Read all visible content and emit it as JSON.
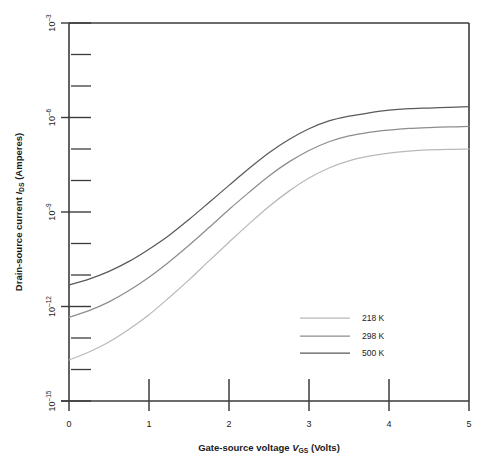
{
  "figure": {
    "background": "#ffffff",
    "axis_color": "#3b3b3b"
  },
  "chart_data": {
    "type": "line",
    "title": "",
    "xlabel_parts": {
      "lead": "Gate-source voltage ",
      "symbol": "V",
      "sub": "GS",
      "tail": " (Volts)"
    },
    "ylabel_parts": {
      "lead": "Drain-source current ",
      "symbol": "I",
      "sub": "DS",
      "tail": " (Amperes)"
    },
    "xlabel": "Gate-source voltage VGS (Volts)",
    "ylabel": "Drain-source current IDS (Amperes)",
    "xlim": [
      0,
      5
    ],
    "ylim": [
      1e-15,
      0.001
    ],
    "yscale": "log",
    "xticks": [
      0,
      1,
      2,
      3,
      4,
      5
    ],
    "xticklabels": [
      "0",
      "1",
      "2",
      "3",
      "4",
      "5"
    ],
    "yticks_major_exponents": [
      -3,
      -6,
      -9,
      -12,
      -15
    ],
    "yticklabels": [
      "10-3",
      "10-6",
      "10-9",
      "10-12",
      "10-15"
    ],
    "yticks_minor_exponents": [
      -4,
      -5,
      -7,
      -8,
      -10,
      -11,
      -13,
      -14
    ],
    "grid": false,
    "legend_position": "lower right",
    "series": [
      {
        "name": "218 K",
        "color": "#b9b9b9",
        "x": [
          0.0,
          0.25,
          0.5,
          0.75,
          1.0,
          1.25,
          1.5,
          1.75,
          2.0,
          2.25,
          2.5,
          2.75,
          3.0,
          3.25,
          3.5,
          3.75,
          4.0,
          4.25,
          4.5,
          4.75,
          5.0
        ],
        "y": [
          2e-14,
          3.6e-14,
          7.5e-14,
          1.9e-13,
          5.5e-13,
          1.9e-12,
          7e-12,
          2.8e-11,
          1.1e-10,
          4.2e-10,
          1.5e-09,
          4.6e-09,
          1.2e-08,
          2.5e-08,
          4.2e-08,
          5.9e-08,
          7.4e-08,
          8.5e-08,
          9.3e-08,
          9.8e-08,
          1e-07
        ]
      },
      {
        "name": "298 K",
        "color": "#8d8d8d",
        "x": [
          0.0,
          0.25,
          0.5,
          0.75,
          1.0,
          1.25,
          1.5,
          1.75,
          2.0,
          2.25,
          2.5,
          2.75,
          3.0,
          3.25,
          3.5,
          3.75,
          4.0,
          4.25,
          4.5,
          4.75,
          5.0
        ],
        "y": [
          4.5e-13,
          7.4e-13,
          1.4e-12,
          3.2e-12,
          8.5e-12,
          2.6e-11,
          8.8e-11,
          3.2e-10,
          1.2e-09,
          4.2e-09,
          1.4e-08,
          3.9e-08,
          9e-08,
          1.7e-07,
          2.6e-07,
          3.4e-07,
          4e-07,
          4.5e-07,
          4.8e-07,
          5e-07,
          5.2e-07
        ]
      },
      {
        "name": "500 K",
        "color": "#5a5a5a",
        "x": [
          0.0,
          0.25,
          0.5,
          0.75,
          1.0,
          1.25,
          1.5,
          1.75,
          2.0,
          2.25,
          2.5,
          2.75,
          3.0,
          3.25,
          3.5,
          3.75,
          4.0,
          4.25,
          4.5,
          4.75,
          5.0
        ],
        "y": [
          4.8e-12,
          7.4e-12,
          1.3e-11,
          2.7e-11,
          6.6e-11,
          1.8e-10,
          5.8e-10,
          2e-09,
          7e-09,
          2.4e-08,
          7.6e-08,
          2e-07,
          4.4e-07,
          7.8e-07,
          1.1e-06,
          1.4e-06,
          1.7e-06,
          1.9e-06,
          2e-06,
          2.1e-06,
          2.2e-06
        ]
      }
    ]
  }
}
